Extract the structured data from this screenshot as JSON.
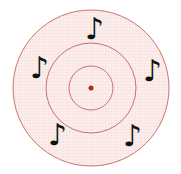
{
  "figure": {
    "center": [
      91,
      88
    ],
    "rings": [
      78,
      45,
      22
    ],
    "ring_color": "#c0504d",
    "fill_color": "#fbeeec",
    "grid_color": "#f0d6d2",
    "center_dot_color": "#b5281e"
  },
  "notes": [
    {
      "glyph": "♪",
      "x": 85,
      "y": 14
    },
    {
      "glyph": "♪",
      "x": 30,
      "y": 53
    },
    {
      "glyph": "♪",
      "x": 143,
      "y": 56
    },
    {
      "glyph": "♪",
      "x": 48,
      "y": 120
    },
    {
      "glyph": "♪",
      "x": 123,
      "y": 121
    }
  ]
}
